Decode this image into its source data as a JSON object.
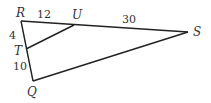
{
  "diagram": {
    "points": {
      "R": {
        "label": "R",
        "x": 21,
        "y": 21
      },
      "U": {
        "label": "U",
        "x": 74,
        "y": 25
      },
      "S": {
        "label": "S",
        "x": 188,
        "y": 32
      },
      "T": {
        "label": "T",
        "x": 26,
        "y": 49
      },
      "Q": {
        "label": "Q",
        "x": 33,
        "y": 81
      }
    },
    "segments": [
      {
        "from": "R",
        "to": "S"
      },
      {
        "from": "R",
        "to": "Q"
      },
      {
        "from": "Q",
        "to": "S"
      },
      {
        "from": "T",
        "to": "U"
      }
    ],
    "lengths": {
      "RU": "12",
      "US": "30",
      "RT": "4",
      "TQ": "10"
    }
  }
}
